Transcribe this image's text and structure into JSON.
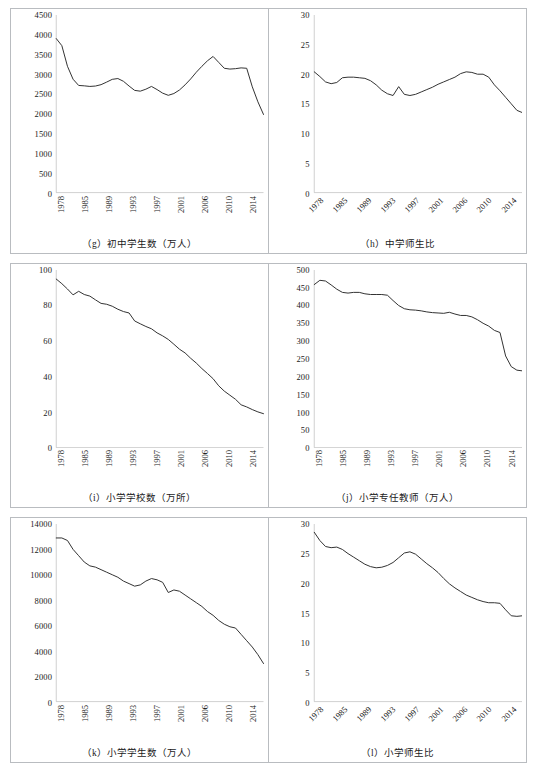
{
  "figure": {
    "series_color": "#333333",
    "axis_color": "#b0b0b0",
    "panel_border_color": "#b9bcc0"
  },
  "panels": [
    {
      "id": "g",
      "caption": "（g）初中学生数（万人）",
      "xlabel_rotation": "90"
    },
    {
      "id": "h",
      "caption": "（h）中学师生比",
      "xlabel_rotation": "45"
    },
    {
      "id": "i",
      "caption": "（i）小学学校数（万所）",
      "xlabel_rotation": "90"
    },
    {
      "id": "j",
      "caption": "（j）小学专任教师（万人）",
      "xlabel_rotation": "90"
    },
    {
      "id": "k",
      "caption": "（k）小学学生数（万人）",
      "xlabel_rotation": "90"
    },
    {
      "id": "l",
      "caption": "（l）小学师生比",
      "xlabel_rotation": "45"
    }
  ],
  "chart_data": [
    {
      "type": "line",
      "panel": "g",
      "title": "（g）初中学生数（万人）",
      "xlabel": "",
      "ylabel": "",
      "ylim": [
        0,
        4500
      ],
      "yticks": [
        0,
        500,
        1000,
        1500,
        2000,
        2500,
        3000,
        3500,
        4000,
        4500
      ],
      "ytick_labels": [
        "0",
        "500",
        "1000",
        "1500",
        "2000",
        "2500",
        "3000",
        "3500",
        "4000",
        "4500"
      ],
      "xtick_labels": [
        "1978",
        "1985",
        "1989",
        "1993",
        "1997",
        "2001",
        "2006",
        "2010",
        "2014"
      ],
      "grid": false,
      "legend": "none",
      "x": [
        1978,
        1979,
        1980,
        1981,
        1982,
        1983,
        1984,
        1985,
        1986,
        1987,
        1988,
        1989,
        1990,
        1991,
        1992,
        1993,
        1994,
        1995,
        1996,
        1997,
        1998,
        1999,
        2000,
        2001,
        2002,
        2003,
        2004,
        2005,
        2006,
        2007,
        2008,
        2009,
        2010,
        2011,
        2012,
        2013,
        2014,
        2015
      ],
      "values": [
        3903,
        3723,
        3201,
        2873,
        2715,
        2705,
        2690,
        2700,
        2735,
        2800,
        2870,
        2890,
        2820,
        2700,
        2590,
        2570,
        2620,
        2690,
        2610,
        2520,
        2465,
        2510,
        2600,
        2730,
        2880,
        3050,
        3200,
        3340,
        3450,
        3300,
        3150,
        3130,
        3140,
        3160,
        3150,
        2680,
        2300,
        1980
      ]
    },
    {
      "type": "line",
      "panel": "h",
      "title": "（h）中学师生比",
      "xlabel": "",
      "ylabel": "",
      "ylim": [
        0,
        30
      ],
      "yticks": [
        0,
        5,
        10,
        15,
        20,
        25,
        30
      ],
      "ytick_labels": [
        "0",
        "5",
        "10",
        "15",
        "20",
        "25",
        "30"
      ],
      "xtick_labels": [
        "1978",
        "1985",
        "1989",
        "1993",
        "1997",
        "2001",
        "2006",
        "2010",
        "2014"
      ],
      "grid": false,
      "legend": "none",
      "x": [
        1978,
        1979,
        1980,
        1981,
        1982,
        1983,
        1984,
        1985,
        1986,
        1987,
        1988,
        1989,
        1990,
        1991,
        1992,
        1993,
        1994,
        1995,
        1996,
        1997,
        1998,
        1999,
        2000,
        2001,
        2002,
        2003,
        2004,
        2005,
        2006,
        2007,
        2008,
        2009,
        2010,
        2011,
        2012,
        2013,
        2014,
        2015
      ],
      "values": [
        20.4,
        19.6,
        18.7,
        18.4,
        18.6,
        19.4,
        19.5,
        19.5,
        19.4,
        19.3,
        18.9,
        18.2,
        17.3,
        16.7,
        16.4,
        17.9,
        16.6,
        16.4,
        16.6,
        17.0,
        17.4,
        17.8,
        18.3,
        18.7,
        19.1,
        19.5,
        20.1,
        20.4,
        20.3,
        20.0,
        20.0,
        19.5,
        18.2,
        17.2,
        16.1,
        15.0,
        13.9,
        13.5
      ]
    },
    {
      "type": "line",
      "panel": "i",
      "title": "（i）小学学校数（万所）",
      "xlabel": "",
      "ylabel": "",
      "ylim": [
        0,
        100
      ],
      "yticks": [
        0,
        20,
        40,
        60,
        80,
        100
      ],
      "ytick_labels": [
        "0",
        "20",
        "40",
        "60",
        "80",
        "100"
      ],
      "xtick_labels": [
        "1978",
        "1985",
        "1989",
        "1993",
        "1997",
        "2001",
        "2006",
        "2010",
        "2014"
      ],
      "grid": false,
      "legend": "none",
      "x": [
        1978,
        1979,
        1980,
        1981,
        1982,
        1983,
        1984,
        1985,
        1986,
        1987,
        1988,
        1989,
        1990,
        1991,
        1992,
        1993,
        1994,
        1995,
        1996,
        1997,
        1998,
        1999,
        2000,
        2001,
        2002,
        2003,
        2004,
        2005,
        2006,
        2007,
        2008,
        2009,
        2010,
        2011,
        2012,
        2013,
        2014,
        2015
      ],
      "values": [
        94.9,
        92.3,
        89.3,
        86.0,
        88.0,
        86.2,
        85.3,
        83.2,
        81.2,
        80.7,
        79.6,
        77.9,
        76.6,
        75.8,
        71.3,
        69.7,
        68.2,
        66.9,
        64.6,
        62.9,
        60.9,
        58.2,
        55.4,
        53.3,
        50.3,
        47.6,
        44.5,
        41.7,
        38.8,
        34.8,
        31.8,
        29.5,
        27.2,
        24.1,
        22.9,
        21.4,
        20.1,
        19.1
      ]
    },
    {
      "type": "line",
      "panel": "j",
      "title": "（j）小学专任教师（万人）",
      "xlabel": "",
      "ylabel": "",
      "ylim": [
        0,
        500
      ],
      "yticks": [
        0,
        50,
        100,
        150,
        200,
        250,
        300,
        350,
        400,
        450,
        500
      ],
      "ytick_labels": [
        "0",
        "50",
        "100",
        "150",
        "200",
        "250",
        "300",
        "350",
        "400",
        "450",
        "500"
      ],
      "xtick_labels": [
        "1978",
        "1985",
        "1989",
        "1993",
        "1997",
        "2001",
        "2006",
        "2010",
        "2014"
      ],
      "grid": false,
      "legend": "none",
      "x": [
        1978,
        1979,
        1980,
        1981,
        1982,
        1983,
        1984,
        1985,
        1986,
        1987,
        1988,
        1989,
        1990,
        1991,
        1992,
        1993,
        1994,
        1995,
        1996,
        1997,
        1998,
        1999,
        2000,
        2001,
        2002,
        2003,
        2004,
        2005,
        2006,
        2007,
        2008,
        2009,
        2010,
        2011,
        2012,
        2013,
        2014,
        2015
      ],
      "values": [
        459,
        471,
        469,
        458,
        446,
        437,
        435,
        437,
        437,
        433,
        431,
        431,
        431,
        429,
        414,
        400,
        391,
        388,
        387,
        385,
        382,
        380,
        379,
        378,
        381,
        376,
        372,
        372,
        368,
        360,
        350,
        342,
        330,
        324,
        258,
        228,
        218,
        216
      ]
    },
    {
      "type": "line",
      "panel": "k",
      "title": "（k）小学学生数（万人）",
      "xlabel": "",
      "ylabel": "",
      "ylim": [
        0,
        14000
      ],
      "yticks": [
        0,
        2000,
        4000,
        6000,
        8000,
        10000,
        12000,
        14000
      ],
      "ytick_labels": [
        "0",
        "2000",
        "4000",
        "6000",
        "8000",
        "10000",
        "12000",
        "14000"
      ],
      "xtick_labels": [
        "1978",
        "1985",
        "1989",
        "1993",
        "1997",
        "2001",
        "2006",
        "2010",
        "2014"
      ],
      "grid": false,
      "legend": "none",
      "x": [
        1978,
        1979,
        1980,
        1981,
        1982,
        1983,
        1984,
        1985,
        1986,
        1987,
        1988,
        1989,
        1990,
        1991,
        1992,
        1993,
        1994,
        1995,
        1996,
        1997,
        1998,
        1999,
        2000,
        2001,
        2002,
        2003,
        2004,
        2005,
        2006,
        2007,
        2008,
        2009,
        2010,
        2011,
        2012,
        2013,
        2014,
        2015
      ],
      "values": [
        12900,
        12900,
        12700,
        12000,
        11500,
        11000,
        10700,
        10600,
        10400,
        10200,
        10000,
        9800,
        9500,
        9300,
        9100,
        9200,
        9500,
        9700,
        9600,
        9400,
        8600,
        8800,
        8700,
        8400,
        8100,
        7800,
        7500,
        7100,
        6800,
        6400,
        6100,
        5900,
        5800,
        5300,
        4800,
        4300,
        3700,
        3000
      ]
    },
    {
      "type": "line",
      "panel": "l",
      "title": "（l）小学师生比",
      "xlabel": "",
      "ylabel": "",
      "ylim": [
        0,
        30
      ],
      "yticks": [
        0,
        5,
        10,
        15,
        20,
        25,
        30
      ],
      "ytick_labels": [
        "0",
        "5",
        "10",
        "15",
        "20",
        "25",
        "30"
      ],
      "xtick_labels": [
        "1978",
        "1985",
        "1989",
        "1993",
        "1997",
        "2001",
        "2006",
        "2010",
        "2014"
      ],
      "grid": false,
      "legend": "none",
      "x": [
        1978,
        1979,
        1980,
        1981,
        1982,
        1983,
        1984,
        1985,
        1986,
        1987,
        1988,
        1989,
        1990,
        1991,
        1992,
        1993,
        1994,
        1995,
        1996,
        1997,
        1998,
        1999,
        2000,
        2001,
        2002,
        2003,
        2004,
        2005,
        2006,
        2007,
        2008,
        2009,
        2010,
        2011,
        2012,
        2013,
        2014,
        2015
      ],
      "values": [
        28.6,
        27.2,
        26.2,
        26.0,
        26.1,
        25.7,
        25.0,
        24.4,
        23.8,
        23.2,
        22.8,
        22.6,
        22.7,
        23.0,
        23.5,
        24.3,
        25.1,
        25.3,
        24.9,
        24.1,
        23.3,
        22.6,
        21.8,
        20.8,
        19.9,
        19.2,
        18.6,
        18.0,
        17.6,
        17.2,
        16.9,
        16.7,
        16.7,
        16.6,
        15.5,
        14.5,
        14.4,
        14.5
      ]
    }
  ]
}
